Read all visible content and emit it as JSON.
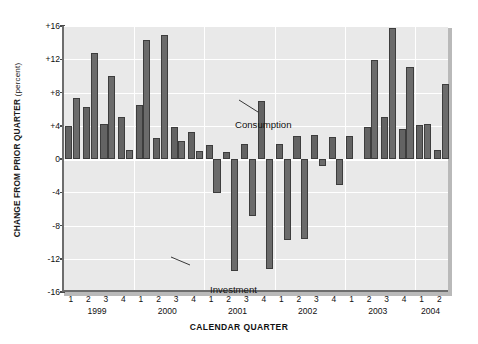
{
  "chart_data": {
    "type": "bar",
    "title": "",
    "xlabel": "CALENDAR QUARTER",
    "ylabel": "CHANGE FROM PRIOR QUARTER (percent)",
    "ylabel_main": "CHANGE FROM PRIOR QUARTER",
    "ylabel_unit": "(percent)",
    "ylim": [
      -16,
      16
    ],
    "ytick_values": [
      16,
      12,
      8,
      4,
      0,
      -4,
      -8,
      -12,
      -16
    ],
    "ytick_labels": [
      "+16",
      "+12",
      "+8",
      "+4",
      "0",
      "-4",
      "-8",
      "-12",
      "-16"
    ],
    "grid": true,
    "legend": "annotations",
    "categories": [
      "1999 Q1",
      "1999 Q2",
      "1999 Q3",
      "1999 Q4",
      "2000 Q1",
      "2000 Q2",
      "2000 Q3",
      "2000 Q4",
      "2001 Q1",
      "2001 Q2",
      "2001 Q3",
      "2001 Q4",
      "2002 Q1",
      "2002 Q2",
      "2002 Q3",
      "2002 Q4",
      "2003 Q1",
      "2003 Q2",
      "2003 Q3",
      "2003 Q4",
      "2004 Q1",
      "2004 Q2"
    ],
    "quarter_labels": [
      "1",
      "2",
      "3",
      "4",
      "1",
      "2",
      "3",
      "4",
      "1",
      "2",
      "3",
      "4",
      "1",
      "2",
      "3",
      "4",
      "1",
      "2",
      "3",
      "4",
      "1",
      "2"
    ],
    "year_groups": [
      {
        "year": "1999",
        "quarters": [
          "1",
          "2",
          "3",
          "4"
        ]
      },
      {
        "year": "2000",
        "quarters": [
          "1",
          "2",
          "3",
          "4"
        ]
      },
      {
        "year": "2001",
        "quarters": [
          "1",
          "2",
          "3",
          "4"
        ]
      },
      {
        "year": "2002",
        "quarters": [
          "1",
          "2",
          "3",
          "4"
        ]
      },
      {
        "year": "2003",
        "quarters": [
          "1",
          "2",
          "3",
          "4"
        ]
      },
      {
        "year": "2004",
        "quarters": [
          "1",
          "2"
        ]
      }
    ],
    "series": [
      {
        "name": "Consumption",
        "color": "#636363",
        "values": [
          4.0,
          6.3,
          4.2,
          5.0,
          6.5,
          2.5,
          3.9,
          3.3,
          1.7,
          0.9,
          1.8,
          7.0,
          1.8,
          2.8,
          2.9,
          2.6,
          2.8,
          3.9,
          5.0,
          3.6,
          4.1,
          1.1
        ]
      },
      {
        "name": "Investment",
        "color": "#6b6b6b",
        "values": [
          7.3,
          12.7,
          10.0,
          1.1,
          14.3,
          14.9,
          2.2,
          1.0,
          -4.1,
          -13.5,
          -6.9,
          -13.2,
          -9.7,
          -9.6,
          -0.9,
          -3.1,
          0.0,
          11.9,
          15.8,
          11.1,
          4.2,
          9.0
        ]
      }
    ],
    "annotations": [
      {
        "text": "Consumption",
        "target": "2001 Q4 Consumption bar"
      },
      {
        "text": "Investment",
        "target": "2001 Q2 Investment bar"
      }
    ]
  },
  "colors": {
    "plot_background": "#e9e9e9",
    "gridline": "#ffffff",
    "axis": "#6d6d6d",
    "bar": "#636363",
    "page_background": "#ffffff"
  }
}
